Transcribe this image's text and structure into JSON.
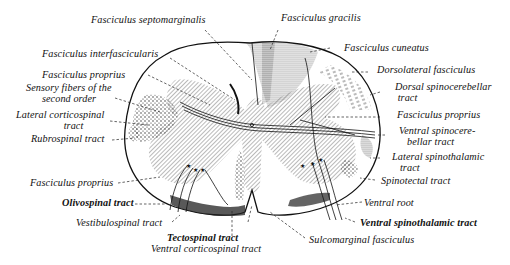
{
  "colors": {
    "ink": "#111111",
    "background": "#ffffff",
    "hatch": "#555555"
  },
  "labels": {
    "fasciculus_septomarginalis": "Fasciculus septomarginalis",
    "fasciculus_gracilis": "Fasciculus gracilis",
    "fasciculus_interfascicularis": "Fasciculus interfascicularis",
    "fasciculus_cuneatus": "Fasciculus cuneatus",
    "fasciculus_proprius_left_upper": "Fasciculus proprius",
    "dorsolateral_fasciculus": "Dorsolateral fasciculus",
    "sensory_fibers": "Sensory fibers of the\n      second order",
    "dorsal_spinocerebellar": "Dorsal spinocerebellar\n tract",
    "lateral_corticospinal": "Lateral corticospinal\n                  tract",
    "fasciculus_proprius_right": "Fasciculus proprius",
    "rubrospinal": "Rubrospinal tract",
    "ventral_spinocerebellar": "Ventral spinocere-\n   bellar tract",
    "lateral_spinothalamic": "Lateral spinothalamic\n   tract",
    "spinotectal": "Spinotectal tract",
    "fasciculus_proprius_left_lower": "Fasciculus proprius",
    "olivospinal": "Olivospinal tract",
    "ventral_root": "Ventral root",
    "vestibulospinal": "Vestibulospinal tract",
    "ventral_spinothalamic": "Ventral spinothalamic tract",
    "tectospinal": "Tectospinal tract",
    "sulcomarginal": "Sulcomarginal fasciculus",
    "ventral_corticospinal": "Ventral corticospinal tract"
  }
}
